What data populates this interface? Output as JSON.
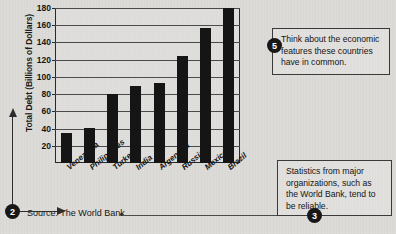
{
  "chart_data": {
    "type": "bar",
    "title": "",
    "xlabel": "",
    "ylabel": "Total Debt (Billions of Dollars)",
    "categories": [
      "Venezuela",
      "Philippines",
      "Turkey",
      "India",
      "Argentina",
      "Russia",
      "Mexico",
      "Brazil"
    ],
    "values": [
      35,
      41,
      80,
      89,
      93,
      124,
      157,
      180
    ],
    "ylim": [
      0,
      180
    ],
    "yticks": [
      20,
      40,
      60,
      80,
      100,
      120,
      140,
      160,
      180
    ],
    "grid": true,
    "legend": "none",
    "bar_color": "#151515"
  },
  "source": {
    "text": "Source: The World Bank"
  },
  "markers": {
    "two": "2",
    "three": "3",
    "five": "5"
  },
  "callouts": {
    "top": "Think about the economic features these countries have in common.",
    "bottom": "Statistics from major organizations, such as the World Bank, tend to be reliable."
  }
}
